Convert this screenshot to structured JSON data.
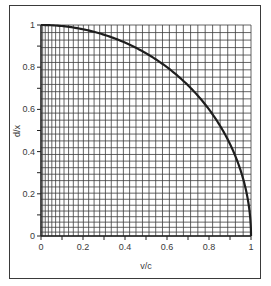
{
  "chart_data": {
    "type": "line",
    "title": "",
    "xlabel": "v/c",
    "ylabel": "d/x",
    "xlim": [
      0,
      1
    ],
    "ylim": [
      0,
      1
    ],
    "grid": true,
    "x_ticks": [
      "0",
      "0.2",
      "0.4",
      "0.6",
      "0.8",
      "1"
    ],
    "y_ticks": [
      "0",
      "0.2",
      "0.4",
      "0.6",
      "0.8",
      "1"
    ],
    "series": [
      {
        "name": "d/x = sqrt(1 - (v/c)^2)",
        "x": [
          0,
          0.1,
          0.2,
          0.3,
          0.4,
          0.5,
          0.6,
          0.7,
          0.8,
          0.9,
          0.95,
          0.98,
          1.0
        ],
        "values": [
          1.0,
          0.995,
          0.98,
          0.954,
          0.917,
          0.866,
          0.8,
          0.714,
          0.6,
          0.436,
          0.312,
          0.199,
          0.0
        ]
      }
    ],
    "legend": null
  },
  "colors": {
    "line": "#1e1e1e",
    "grid": "#3c3c3c",
    "frame": "#3a3a3a",
    "text": "#3a3a3a"
  }
}
